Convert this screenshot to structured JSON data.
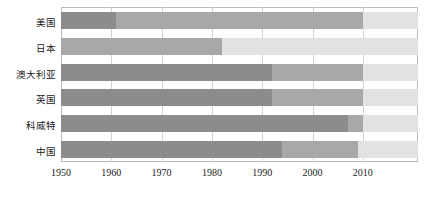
{
  "chart_data": {
    "type": "bar",
    "orientation": "horizontal",
    "stacked": true,
    "title": "",
    "xlabel": "",
    "ylabel": "",
    "xlim": [
      1950,
      2021
    ],
    "grid": true,
    "legend": "none",
    "categories": [
      "美国",
      "日本",
      "澳大利亚",
      "英国",
      "科威特",
      "中国"
    ],
    "tick_labels": [
      "1950",
      "1960",
      "1970",
      "1980",
      "1990",
      "2000",
      "2010"
    ],
    "tick_values": [
      1950,
      1960,
      1970,
      1980,
      1990,
      2000,
      2010
    ],
    "series": [
      {
        "name": "dark",
        "color": "#8c8c8c"
      },
      {
        "name": "medium",
        "color": "#a8a8a8"
      },
      {
        "name": "light",
        "color": "#e2e2e2"
      }
    ],
    "bars": [
      {
        "category": "美国",
        "start": 1950,
        "segments": [
          {
            "shade": "dark",
            "from": 1950,
            "to": 1961,
            "color": "#8c8c8c"
          },
          {
            "shade": "medium",
            "from": 1961,
            "to": 2010,
            "color": "#a8a8a8"
          },
          {
            "shade": "light",
            "from": 2010,
            "to": 2021,
            "color": "#e2e2e2"
          }
        ]
      },
      {
        "category": "日本",
        "start": 1950,
        "segments": [
          {
            "shade": "medium",
            "from": 1950,
            "to": 1982,
            "color": "#a8a8a8"
          },
          {
            "shade": "light",
            "from": 1982,
            "to": 2021,
            "color": "#e2e2e2"
          }
        ]
      },
      {
        "category": "澳大利亚",
        "start": 1950,
        "segments": [
          {
            "shade": "dark",
            "from": 1950,
            "to": 1992,
            "color": "#8c8c8c"
          },
          {
            "shade": "medium",
            "from": 1992,
            "to": 2010,
            "color": "#a8a8a8"
          },
          {
            "shade": "light",
            "from": 2010,
            "to": 2021,
            "color": "#e2e2e2"
          }
        ]
      },
      {
        "category": "英国",
        "start": 1950,
        "segments": [
          {
            "shade": "dark",
            "from": 1950,
            "to": 1992,
            "color": "#8c8c8c"
          },
          {
            "shade": "medium",
            "from": 1992,
            "to": 2010,
            "color": "#a8a8a8"
          },
          {
            "shade": "light",
            "from": 2010,
            "to": 2021,
            "color": "#e2e2e2"
          }
        ]
      },
      {
        "category": "科威特",
        "start": 1950,
        "segments": [
          {
            "shade": "dark",
            "from": 1950,
            "to": 2007,
            "color": "#8c8c8c"
          },
          {
            "shade": "medium",
            "from": 2007,
            "to": 2010,
            "color": "#a8a8a8"
          },
          {
            "shade": "light",
            "from": 2010,
            "to": 2021,
            "color": "#e2e2e2"
          }
        ]
      },
      {
        "category": "中国",
        "start": 1950,
        "segments": [
          {
            "shade": "dark",
            "from": 1950,
            "to": 1994,
            "color": "#8c8c8c"
          },
          {
            "shade": "medium",
            "from": 1994,
            "to": 2009,
            "color": "#a8a8a8"
          },
          {
            "shade": "light",
            "from": 2009,
            "to": 2021,
            "color": "#e2e2e2"
          }
        ]
      }
    ]
  },
  "axis": {
    "frame_color": "#b9b9b9",
    "grid_color": "#d3d3d3"
  }
}
